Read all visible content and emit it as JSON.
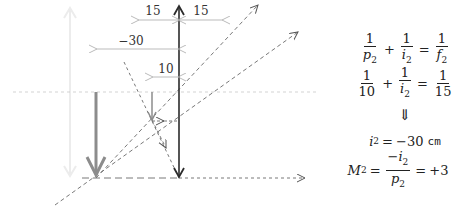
{
  "diagram": {
    "dimensions": {
      "focal_left_label": "15",
      "focal_right_label": "15",
      "image_distance_label": "−30",
      "object_distance_label": "10"
    },
    "colors": {
      "lens": "#2b2b2b",
      "object": "#8c8c8c",
      "image": "#8c8c8c",
      "faint_arrow": "#ececec",
      "axis": "#c8c8c8",
      "rays": "#555555",
      "dimension": "#aaaaaa"
    }
  },
  "equations": {
    "line1": {
      "a_num": "1",
      "a_den": "p",
      "a_sub": "2",
      "op": "+",
      "b_num": "1",
      "b_den": "i",
      "b_sub": "2",
      "eq": "=",
      "c_num": "1",
      "c_den": "f",
      "c_sub": "2"
    },
    "line2": {
      "a_num": "1",
      "a_den": "10",
      "op": "+",
      "b_num": "1",
      "b_den": "i",
      "b_sub": "2",
      "eq": "=",
      "c_num": "1",
      "c_den": "15"
    },
    "implies": "⇓",
    "line3": {
      "lhs": "i",
      "lhs_sub": "2",
      "eq": "=",
      "value": "−30",
      "unit": "cm"
    },
    "line4": {
      "lhs": "M",
      "lhs_sub": "2",
      "eq": "=",
      "num": "−i",
      "num_sub": "2",
      "den": "p",
      "den_sub": "2",
      "eq2": "=",
      "result": "+3"
    }
  }
}
